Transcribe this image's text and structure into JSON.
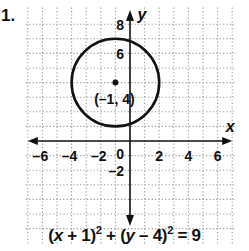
{
  "problem": {
    "number": "1."
  },
  "graph": {
    "x_axis_label": "x",
    "y_axis_label": "y",
    "x_tick_labels": [
      {
        "value": -6,
        "label": "–6"
      },
      {
        "value": -4,
        "label": "–4"
      },
      {
        "value": -2,
        "label": "–2"
      },
      {
        "value": 2,
        "label": "2"
      },
      {
        "value": 4,
        "label": "4"
      },
      {
        "value": 6,
        "label": "6"
      }
    ],
    "y_tick_labels": [
      {
        "value": 8,
        "label": "8"
      },
      {
        "value": 6,
        "label": "6"
      },
      {
        "value": -2,
        "label": "–2"
      }
    ],
    "origin_label": "0",
    "center_label": "(–1, 4)",
    "center": {
      "x": -1,
      "y": 4
    },
    "radius": 3,
    "x_range": [
      -7,
      7
    ],
    "y_range": [
      -7,
      9
    ],
    "grid": "dotted",
    "colors": {
      "ink": "#111111",
      "grid": "#9a9a9a",
      "background": "#ffffff"
    }
  },
  "equation": {
    "part1": "(",
    "var_x": "x",
    "part2": " + 1)",
    "exp1": "2",
    "part3": " + (",
    "var_y": "y",
    "part4": " – 4)",
    "exp2": "2",
    "part5": " = 9"
  }
}
